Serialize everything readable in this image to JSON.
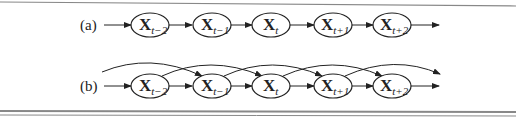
{
  "diagram": {
    "rows": [
      {
        "label": "(a)",
        "description": "first-order Markov chain",
        "nodes": [
          {
            "main": "X",
            "sub": "t−2"
          },
          {
            "main": "X",
            "sub": "t−1"
          },
          {
            "main": "X",
            "sub": "t"
          },
          {
            "main": "X",
            "sub": "t+1"
          },
          {
            "main": "X",
            "sub": "t+2"
          }
        ],
        "edges": [
          "in→X_{t-2}",
          "X_{t-2}→X_{t-1}",
          "X_{t-1}→X_t",
          "X_t→X_{t+1}",
          "X_{t+1}→X_{t+2}",
          "X_{t+2}→out"
        ]
      },
      {
        "label": "(b)",
        "description": "second-order Markov chain",
        "nodes": [
          {
            "main": "X",
            "sub": "t−2"
          },
          {
            "main": "X",
            "sub": "t−1"
          },
          {
            "main": "X",
            "sub": "t"
          },
          {
            "main": "X",
            "sub": "t+1"
          },
          {
            "main": "X",
            "sub": "t+2"
          }
        ],
        "edges": [
          "in→X_{t-2}",
          "X_{t-2}→X_{t-1}",
          "X_{t-1}→X_t",
          "X_t→X_{t+1}",
          "X_{t+1}→X_{t+2}",
          "X_{t+2}→out"
        ],
        "skip_edges": [
          "in→X_{t-1}",
          "X_{t-2}→X_t",
          "X_{t-1}→X_{t+1}",
          "X_t→X_{t+2}",
          "X_{t+1}→out"
        ]
      }
    ]
  }
}
